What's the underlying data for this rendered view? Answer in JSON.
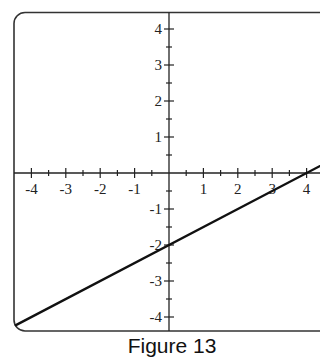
{
  "caption": "Figure 13",
  "chart_data": {
    "type": "line",
    "title": "Figure 13",
    "xlabel": "",
    "ylabel": "",
    "xlim": [
      -4.5,
      4.5
    ],
    "ylim": [
      -4.5,
      4.5
    ],
    "grid": false,
    "x_ticks": [
      -4,
      -3,
      -2,
      -1,
      1,
      2,
      3,
      4
    ],
    "y_ticks": [
      4,
      3,
      2,
      1,
      -1,
      -2,
      -3,
      -4
    ],
    "minor_tick_step": 0.5,
    "series": [
      {
        "name": "line",
        "equation": "y = 0.5x - 2",
        "slope": 0.5,
        "intercept": -2,
        "x": [
          -4.5,
          4.5
        ],
        "y": [
          -4.25,
          0.25
        ]
      }
    ],
    "legend": null
  },
  "colors": {
    "axis": "#222222",
    "line": "#111111",
    "frame": "#333333"
  }
}
